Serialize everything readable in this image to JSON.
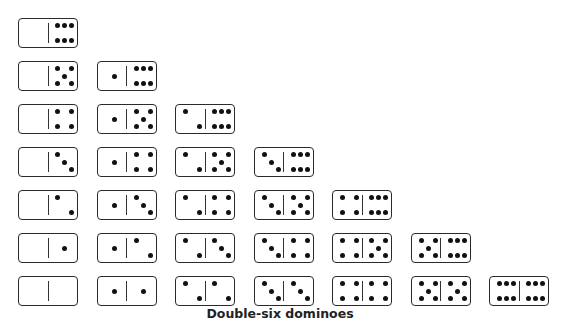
{
  "caption": "Double-six dominoes",
  "layout": {
    "origin_x": 18,
    "origin_y": 18,
    "col_step": 78.5,
    "row_step": 43
  },
  "dominoes": [
    {
      "row": 0,
      "col": 0,
      "left": 0,
      "right": 6
    },
    {
      "row": 1,
      "col": 0,
      "left": 0,
      "right": 5
    },
    {
      "row": 1,
      "col": 1,
      "left": 1,
      "right": 6
    },
    {
      "row": 2,
      "col": 0,
      "left": 0,
      "right": 4
    },
    {
      "row": 2,
      "col": 1,
      "left": 1,
      "right": 5
    },
    {
      "row": 2,
      "col": 2,
      "left": 2,
      "right": 6
    },
    {
      "row": 3,
      "col": 0,
      "left": 0,
      "right": 3
    },
    {
      "row": 3,
      "col": 1,
      "left": 1,
      "right": 4
    },
    {
      "row": 3,
      "col": 2,
      "left": 2,
      "right": 5
    },
    {
      "row": 3,
      "col": 3,
      "left": 3,
      "right": 6
    },
    {
      "row": 4,
      "col": 0,
      "left": 0,
      "right": 2
    },
    {
      "row": 4,
      "col": 1,
      "left": 1,
      "right": 3
    },
    {
      "row": 4,
      "col": 2,
      "left": 2,
      "right": 4
    },
    {
      "row": 4,
      "col": 3,
      "left": 3,
      "right": 5
    },
    {
      "row": 4,
      "col": 4,
      "left": 4,
      "right": 6
    },
    {
      "row": 5,
      "col": 0,
      "left": 0,
      "right": 1
    },
    {
      "row": 5,
      "col": 1,
      "left": 1,
      "right": 2
    },
    {
      "row": 5,
      "col": 2,
      "left": 2,
      "right": 3
    },
    {
      "row": 5,
      "col": 3,
      "left": 3,
      "right": 4
    },
    {
      "row": 5,
      "col": 4,
      "left": 4,
      "right": 5
    },
    {
      "row": 5,
      "col": 5,
      "left": 5,
      "right": 6
    },
    {
      "row": 6,
      "col": 0,
      "left": 0,
      "right": 0
    },
    {
      "row": 6,
      "col": 1,
      "left": 1,
      "right": 1
    },
    {
      "row": 6,
      "col": 2,
      "left": 2,
      "right": 2
    },
    {
      "row": 6,
      "col": 3,
      "left": 3,
      "right": 3
    },
    {
      "row": 6,
      "col": 4,
      "left": 4,
      "right": 4
    },
    {
      "row": 6,
      "col": 5,
      "left": 5,
      "right": 5
    },
    {
      "row": 6,
      "col": 6,
      "left": 6,
      "right": 6
    }
  ]
}
